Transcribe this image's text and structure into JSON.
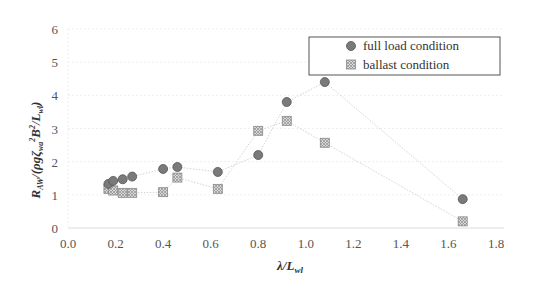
{
  "chart_data": {
    "type": "scatter",
    "title": "",
    "xlabel": "λ/L_wl",
    "ylabel": "R_AW/(ρgζ_wa²B²/L_wl)",
    "xlim": [
      0.0,
      1.8
    ],
    "ylim": [
      0,
      6
    ],
    "x_ticks": [
      "0.0",
      "0.2",
      "0.4",
      "0.6",
      "0.8",
      "1.0",
      "1.2",
      "1.4",
      "1.6",
      "1.8"
    ],
    "y_ticks": [
      "0",
      "1",
      "2",
      "3",
      "4",
      "5",
      "6"
    ],
    "grid": true,
    "legend_position": "upper right",
    "series": [
      {
        "name": "full load condition",
        "marker": "circle",
        "color": "#7a7a7a",
        "line": "dotted",
        "x": [
          0.17,
          0.19,
          0.23,
          0.27,
          0.4,
          0.46,
          0.63,
          0.8,
          0.92,
          1.08,
          1.66
        ],
        "y": [
          1.33,
          1.42,
          1.47,
          1.55,
          1.78,
          1.84,
          1.69,
          2.2,
          3.8,
          4.4,
          0.87
        ]
      },
      {
        "name": "ballast condition",
        "marker": "square-x",
        "color": "#b5b5b5",
        "line": "dotted",
        "x": [
          0.17,
          0.19,
          0.23,
          0.27,
          0.4,
          0.46,
          0.63,
          0.8,
          0.92,
          1.08,
          1.66
        ],
        "y": [
          1.18,
          1.13,
          1.06,
          1.06,
          1.08,
          1.52,
          1.18,
          2.93,
          3.23,
          2.57,
          0.2
        ]
      }
    ]
  },
  "axes": {
    "xlabel_main": "λ/L",
    "xlabel_sub": "wl",
    "ylabel_parts": {
      "r": "R",
      "r_sub": "AW",
      "mid": "/(ρgζ",
      "zeta_sub": "wa",
      "sq1": "2",
      "b": "B",
      "sq2": "2",
      "slash": "/L",
      "l_sub": "wl",
      "close": ")"
    }
  },
  "legend": {
    "items": [
      "full load condition",
      "ballast condition"
    ]
  }
}
